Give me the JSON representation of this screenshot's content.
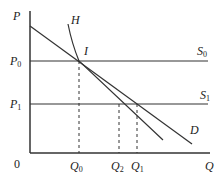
{
  "diagram": {
    "type": "economics-supply-demand",
    "axes": {
      "y_label": "P",
      "x_label": "Q",
      "origin_label": "0"
    },
    "price_levels": [
      {
        "id": "P0",
        "label": "P",
        "sub": "0",
        "supply_label": "S",
        "supply_sub": "0"
      },
      {
        "id": "P1",
        "label": "P",
        "sub": "1",
        "supply_label": "S",
        "supply_sub": "1"
      }
    ],
    "quantities": [
      {
        "id": "Q0",
        "label": "Q",
        "sub": "0"
      },
      {
        "id": "Q2",
        "label": "Q",
        "sub": "2"
      },
      {
        "id": "Q1",
        "label": "Q",
        "sub": "1"
      }
    ],
    "curves": {
      "demand_label": "D",
      "h_label": "H",
      "intersection_label": "I"
    }
  }
}
